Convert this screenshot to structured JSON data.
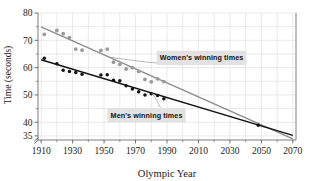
{
  "chart_data": {
    "type": "scatter",
    "title": "",
    "xlabel": "Olympic Year",
    "ylabel": "Time (seconds)",
    "xlim": [
      1908,
      2072
    ],
    "ylim": [
      33.5,
      80
    ],
    "xticks": [
      1910,
      1930,
      1950,
      1970,
      1990,
      2010,
      2030,
      2050,
      2070
    ],
    "xtick_labels": [
      "1910",
      "1930",
      "1950",
      "1970",
      "1990",
      "2010",
      "2030",
      "2050",
      "2070"
    ],
    "yticks": [
      35,
      40,
      50,
      60,
      70,
      80
    ],
    "ytick_labels": [
      "35",
      "40",
      "50",
      "60",
      "70",
      "80"
    ],
    "y_axis_break": true,
    "grid": true,
    "legend_position": "inline-annotations",
    "series": [
      {
        "name": "Women's winning times",
        "color": "#9a9a9a",
        "marker": "circle",
        "points": [
          {
            "x": 1912,
            "y": 72.2
          },
          {
            "x": 1920,
            "y": 73.6
          },
          {
            "x": 1924,
            "y": 72.4
          },
          {
            "x": 1928,
            "y": 71.0
          },
          {
            "x": 1932,
            "y": 66.8
          },
          {
            "x": 1936,
            "y": 66.4
          },
          {
            "x": 1948,
            "y": 66.3
          },
          {
            "x": 1952,
            "y": 66.8
          },
          {
            "x": 1956,
            "y": 62.0
          },
          {
            "x": 1960,
            "y": 61.2
          },
          {
            "x": 1964,
            "y": 59.5
          },
          {
            "x": 1968,
            "y": 60.0
          },
          {
            "x": 1972,
            "y": 58.6
          },
          {
            "x": 1976,
            "y": 55.7
          },
          {
            "x": 1980,
            "y": 54.8
          },
          {
            "x": 1984,
            "y": 55.9
          },
          {
            "x": 1988,
            "y": 54.9
          }
        ],
        "fit_line": {
          "x1": 1910,
          "y1": 74.9,
          "x2": 2070,
          "y2": 33.9
        }
      },
      {
        "name": "Men's winning times",
        "color": "#121212",
        "marker": "circle",
        "points": [
          {
            "x": 1912,
            "y": 63.4
          },
          {
            "x": 1920,
            "y": 61.4
          },
          {
            "x": 1924,
            "y": 59.0
          },
          {
            "x": 1928,
            "y": 58.6
          },
          {
            "x": 1932,
            "y": 58.2
          },
          {
            "x": 1936,
            "y": 57.6
          },
          {
            "x": 1948,
            "y": 57.3
          },
          {
            "x": 1952,
            "y": 57.4
          },
          {
            "x": 1956,
            "y": 55.4
          },
          {
            "x": 1960,
            "y": 55.2
          },
          {
            "x": 1964,
            "y": 53.4
          },
          {
            "x": 1968,
            "y": 52.2
          },
          {
            "x": 1972,
            "y": 51.2
          },
          {
            "x": 1976,
            "y": 49.99
          },
          {
            "x": 1980,
            "y": 50.4
          },
          {
            "x": 1984,
            "y": 49.8
          },
          {
            "x": 1988,
            "y": 48.6
          },
          {
            "x": 2048,
            "y": 38.9
          }
        ],
        "fit_line": {
          "x1": 1910,
          "y1": 62.9,
          "x2": 2070,
          "y2": 35.2
        }
      }
    ],
    "annotations": [
      {
        "text": "Women's winning times",
        "target_series": "Women's winning times",
        "label_x": 2012,
        "label_y": 63.6
      },
      {
        "text": "Men's winning times",
        "target_series": "Men's winning times",
        "label_x": 1977,
        "label_y": 42.6
      }
    ]
  },
  "axes": {
    "xlabel": "Olympic Year",
    "ylabel": "Time (seconds)"
  }
}
